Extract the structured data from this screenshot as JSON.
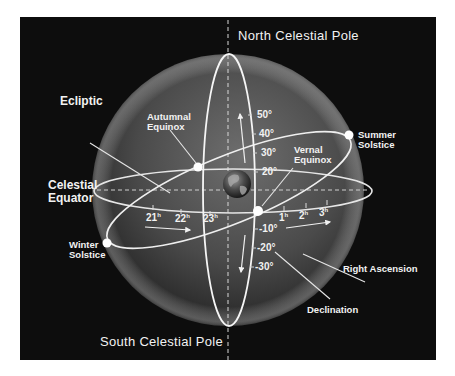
{
  "diagram": {
    "poles": {
      "north": "North Celestial Pole",
      "south": "South Celestial Pole"
    },
    "labels": {
      "ecliptic": "Ecliptic",
      "celestial_equator_line1": "Celestial",
      "celestial_equator_line2": "Equator",
      "autumnal_equinox_line1": "Autumnal",
      "autumnal_equinox_line2": "Equinox",
      "vernal_equinox_line1": "Vernal",
      "vernal_equinox_line2": "Equinox",
      "summer_solstice_line1": "Summer",
      "summer_solstice_line2": "Solstice",
      "winter_solstice_line1": "Winter",
      "winter_solstice_line2": "Solstice",
      "right_ascension": "Right Ascension",
      "declination": "Declination"
    },
    "declination_ticks": [
      "50°",
      "40°",
      "30°",
      "20°",
      "-10°",
      "-20°",
      "-30°"
    ],
    "right_ascension_ticks": [
      {
        "num": "21",
        "unit": "h"
      },
      {
        "num": "22",
        "unit": "h"
      },
      {
        "num": "23",
        "unit": "h"
      },
      {
        "num": "1",
        "unit": "h"
      },
      {
        "num": "2",
        "unit": "h"
      },
      {
        "num": "3",
        "unit": "h"
      }
    ],
    "colors": {
      "background": "#0d0d0d",
      "page": "#ffffff",
      "lines": "#f0f0f0",
      "sphere_light": "#7a7a7a",
      "sphere_dark": "#1a1a1a"
    }
  }
}
